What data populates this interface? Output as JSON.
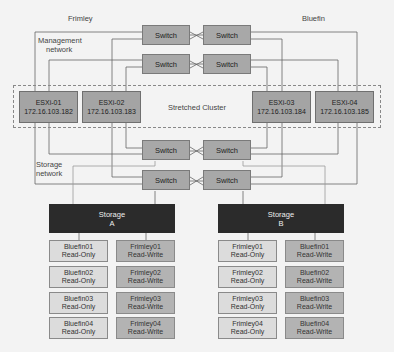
{
  "sites": {
    "left": "Frimley",
    "right": "Bluefin"
  },
  "labels": {
    "management_network": [
      "Management",
      "network"
    ],
    "storage_network": [
      "Storage",
      "network"
    ],
    "stretched_cluster": "Stretched Cluster"
  },
  "switch_label": "Switch",
  "hosts": [
    {
      "name": "ESXi-01",
      "ip": "172.16.103.182"
    },
    {
      "name": "ESXi-02",
      "ip": "172.16.103.183"
    },
    {
      "name": "ESXi-03",
      "ip": "172.16.103.184"
    },
    {
      "name": "ESXi-04",
      "ip": "172.16.103.185"
    }
  ],
  "storage": [
    {
      "title": "Storage",
      "id": "A",
      "datastores": [
        [
          {
            "name": "Bluefin01",
            "mode": "Read-Only"
          },
          {
            "name": "Frimley01",
            "mode": "Read-Write"
          }
        ],
        [
          {
            "name": "Bluefin02",
            "mode": "Read-Only"
          },
          {
            "name": "Frimley02",
            "mode": "Read-Write"
          }
        ],
        [
          {
            "name": "Bluefin03",
            "mode": "Read-Only"
          },
          {
            "name": "Frimley03",
            "mode": "Read-Write"
          }
        ],
        [
          {
            "name": "Bluefin04",
            "mode": "Read-Only"
          },
          {
            "name": "Frimley04",
            "mode": "Read-Write"
          }
        ]
      ]
    },
    {
      "title": "Storage",
      "id": "B",
      "datastores": [
        [
          {
            "name": "Frimley01",
            "mode": "Read-Only"
          },
          {
            "name": "Bluefin01",
            "mode": "Read-Write"
          }
        ],
        [
          {
            "name": "Frimley02",
            "mode": "Read-Only"
          },
          {
            "name": "Bluefin02",
            "mode": "Read-Write"
          }
        ],
        [
          {
            "name": "Frimley03",
            "mode": "Read-Only"
          },
          {
            "name": "Bluefin03",
            "mode": "Read-Write"
          }
        ],
        [
          {
            "name": "Frimley04",
            "mode": "Read-Only"
          },
          {
            "name": "Bluefin04",
            "mode": "Read-Write"
          }
        ]
      ]
    }
  ],
  "colors": {
    "background": "#f3f3f3",
    "switch": "#a8a8a8",
    "host": "#a4a4a4",
    "storage": "#2b2b2b",
    "read_only": "#dcdcdc",
    "read_write": "#b3b3b3",
    "wire": "#666666"
  }
}
